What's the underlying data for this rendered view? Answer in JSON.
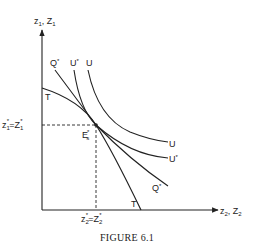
{
  "figure": {
    "caption": "FIGURE 6.1",
    "y_axis_label": {
      "main": "z",
      "sub": "1",
      "sep": ", ",
      "main2": "Z",
      "sub2": "1"
    },
    "x_axis_label": {
      "main": "z",
      "sub": "2",
      "sep": ", ",
      "main2": "Z",
      "sub2": "2"
    },
    "point_label": {
      "main": "E",
      "sup": "*",
      "sub": "s"
    },
    "y_tick_label": {
      "a": "z",
      "a_sub": "1",
      "a_sup": "*",
      "eq": "=",
      "b": "Z",
      "b_sub": "1",
      "b_sup": "*"
    },
    "x_tick_label": {
      "a": "z",
      "a_sub": "2",
      "a_sup": "*",
      "eq": "=",
      "b": "Z",
      "b_sub": "2",
      "b_sup": "*"
    },
    "curves": [
      {
        "id": "T",
        "label_top": "T",
        "label_bottom": "T",
        "type": "transformation-curve"
      },
      {
        "id": "Q*",
        "label_top": "Q",
        "label_bottom": "Q",
        "sup": "*",
        "type": "price-line"
      },
      {
        "id": "U*",
        "label_top": "U",
        "label_bottom": "U",
        "sup": "*",
        "type": "indifference-curve"
      },
      {
        "id": "U",
        "label_top": "U",
        "label_bottom": "U",
        "type": "indifference-curve"
      }
    ],
    "colors": {
      "ink": "#222222",
      "background": "#ffffff"
    }
  }
}
